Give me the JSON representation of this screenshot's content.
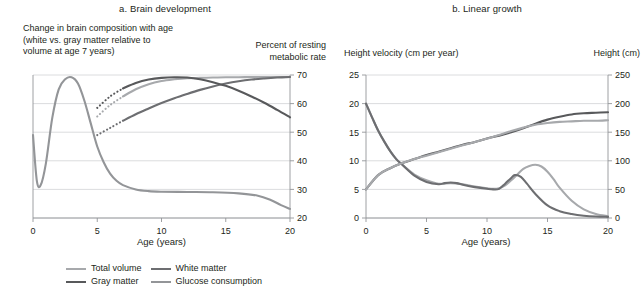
{
  "panel_a": {
    "title": "a. Brain development",
    "left_caption": "Change in brain composition with age\n(white vs. gray matter relative to\nvolume at age 7 years)",
    "right_caption": "Percent of resting\nmetabolic rate",
    "xaxis_title": "Age (years)",
    "legend": [
      {
        "label": "Total volume",
        "color": "#a7a9ac"
      },
      {
        "label": "White matter",
        "color": "#6d6e71"
      },
      {
        "label": "Gray matter",
        "color": "#58595b"
      },
      {
        "label": "Glucose consumption",
        "color": "#939598"
      }
    ]
  },
  "panel_b": {
    "title": "b. Linear growth",
    "left_caption": "Height velocity (cm per year)",
    "right_caption": "Height (cm)",
    "xaxis_title": "Age (years)",
    "legend": [
      {
        "label": "Male velocity",
        "color": "#a7a9ac"
      },
      {
        "label": "Female velocity",
        "color": "#6d6e71"
      },
      {
        "label": "Male height",
        "color": "#58595b"
      },
      {
        "label": "Female height",
        "color": "#a7a9ac"
      }
    ]
  },
  "chart_data": [
    {
      "type": "line",
      "title": "a. Brain development",
      "xlabel": "Age (years)",
      "ylabel": "Percent of resting metabolic rate",
      "xlim": [
        0,
        20
      ],
      "xticks": [
        0,
        5,
        10,
        15,
        20
      ],
      "ylim": [
        20,
        70
      ],
      "yticks": [
        20,
        30,
        40,
        50,
        60,
        70
      ],
      "y_axis_position": "right",
      "grid": "horizontal",
      "legend_position": "bottom",
      "series": [
        {
          "name": "Total volume",
          "color": "#a7a9ac",
          "dashed_segment_x": [
            5,
            7
          ],
          "x": [
            5,
            6,
            7,
            8,
            9,
            10,
            11,
            12,
            13,
            14,
            15,
            16,
            17,
            18,
            19,
            20
          ],
          "y": [
            55.5,
            59.5,
            62.5,
            65.0,
            66.8,
            67.9,
            68.5,
            68.9,
            69.0,
            69.1,
            69.2,
            69.2,
            69.3,
            69.3,
            69.3,
            69.3
          ]
        },
        {
          "name": "White matter",
          "color": "#6d6e71",
          "dashed_segment_x": [
            5,
            7
          ],
          "x": [
            5,
            6,
            7,
            8,
            9,
            10,
            11,
            12,
            13,
            14,
            15,
            16,
            17,
            18,
            19,
            20
          ],
          "y": [
            49.0,
            51.5,
            54.0,
            56.3,
            58.3,
            60.2,
            61.9,
            63.4,
            64.8,
            66.0,
            67.0,
            67.8,
            68.4,
            68.8,
            69.1,
            69.3
          ]
        },
        {
          "name": "Gray matter",
          "color": "#58595b",
          "dashed_segment_x": [
            5,
            7
          ],
          "x": [
            5,
            6,
            7,
            8,
            9,
            10,
            11,
            12,
            13,
            14,
            15,
            16,
            17,
            18,
            19,
            20
          ],
          "y": [
            58.5,
            62.5,
            65.3,
            67.2,
            68.4,
            69.0,
            69.2,
            69.1,
            68.5,
            67.5,
            66.2,
            64.5,
            62.5,
            60.3,
            57.8,
            55.2
          ]
        },
        {
          "name": "Glucose consumption",
          "color": "#939598",
          "x": [
            0,
            0.3,
            0.6,
            1.0,
            1.5,
            2.0,
            2.5,
            3.0,
            3.5,
            4.0,
            4.5,
            5.0,
            5.5,
            6.0,
            6.5,
            7.0,
            8.0,
            9.0,
            10.0,
            12.0,
            14.0,
            16.0,
            17.5,
            18.5,
            19.3,
            20.0
          ],
          "y": [
            49.0,
            33.0,
            31.5,
            39.0,
            55.0,
            65.0,
            68.5,
            69.2,
            67.0,
            61.0,
            53.0,
            45.0,
            39.5,
            35.5,
            33.0,
            31.5,
            30.0,
            29.4,
            29.2,
            29.1,
            29.0,
            28.6,
            27.8,
            26.3,
            24.5,
            23.2
          ]
        }
      ]
    },
    {
      "type": "line",
      "title": "b. Linear growth",
      "xlabel": "Age (years)",
      "ylabel_left": "Height velocity (cm per year)",
      "ylabel_right": "Height (cm)",
      "xlim": [
        0,
        20
      ],
      "xticks": [
        0,
        5,
        10,
        15,
        20
      ],
      "ylim_left": [
        0,
        25
      ],
      "yticks_left": [
        0,
        5,
        10,
        15,
        20,
        25
      ],
      "ylim_right": [
        0,
        250
      ],
      "yticks_right": [
        0,
        50,
        100,
        150,
        200,
        250
      ],
      "grid": "horizontal",
      "legend_position": "bottom",
      "series": [
        {
          "name": "Male velocity",
          "axis": "left",
          "color": "#a7a9ac",
          "x": [
            0,
            0.5,
            1,
            1.5,
            2,
            2.5,
            3,
            4,
            5,
            6,
            7,
            8,
            9,
            10,
            10.5,
            11,
            11.5,
            12,
            12.5,
            13,
            13.5,
            14,
            14.5,
            15,
            15.5,
            16,
            17,
            18,
            19,
            20
          ],
          "y": [
            20.0,
            17.6,
            15.3,
            13.4,
            11.7,
            10.3,
            9.3,
            7.6,
            6.6,
            6.0,
            6.1,
            5.9,
            5.5,
            5.2,
            5.1,
            5.2,
            5.7,
            6.6,
            7.6,
            8.6,
            9.1,
            9.3,
            9.0,
            8.1,
            6.8,
            5.3,
            3.0,
            1.5,
            0.7,
            0.3
          ]
        },
        {
          "name": "Female velocity",
          "axis": "left",
          "color": "#6d6e71",
          "x": [
            0,
            0.5,
            1,
            1.5,
            2,
            2.5,
            3,
            4,
            5,
            6,
            6.5,
            7,
            7.5,
            8,
            9,
            10,
            10.5,
            11,
            11.5,
            12,
            12.3,
            12.8,
            13.3,
            14,
            15,
            16,
            17,
            18,
            19,
            20
          ],
          "y": [
            20.0,
            17.6,
            15.3,
            13.4,
            11.7,
            10.3,
            9.3,
            7.4,
            6.3,
            5.9,
            6.1,
            6.2,
            6.1,
            5.8,
            5.4,
            5.1,
            5.0,
            5.1,
            6.0,
            7.0,
            7.5,
            7.2,
            6.0,
            4.2,
            2.2,
            1.2,
            0.7,
            0.4,
            0.25,
            0.2
          ]
        },
        {
          "name": "Male height",
          "axis": "right",
          "color": "#58595b",
          "x": [
            0,
            1,
            2,
            3,
            4,
            5,
            6,
            7,
            8,
            9,
            10,
            11,
            12,
            13,
            14,
            15,
            16,
            17,
            18,
            19,
            20
          ],
          "y": [
            50,
            75,
            87,
            96,
            103,
            110,
            116,
            122,
            128,
            133,
            139,
            144,
            150,
            157,
            165,
            172,
            177,
            181,
            183,
            184,
            185
          ]
        },
        {
          "name": "Female height",
          "axis": "right",
          "color": "#a7a9ac",
          "x": [
            0,
            1,
            2,
            3,
            4,
            5,
            6,
            7,
            8,
            9,
            10,
            11,
            12,
            13,
            14,
            15,
            16,
            17,
            18,
            19,
            20
          ],
          "y": [
            50,
            75,
            87,
            96,
            103,
            109,
            115,
            121,
            127,
            133,
            139,
            145,
            152,
            158,
            163,
            166,
            168,
            169,
            170,
            170,
            171
          ]
        }
      ]
    }
  ]
}
